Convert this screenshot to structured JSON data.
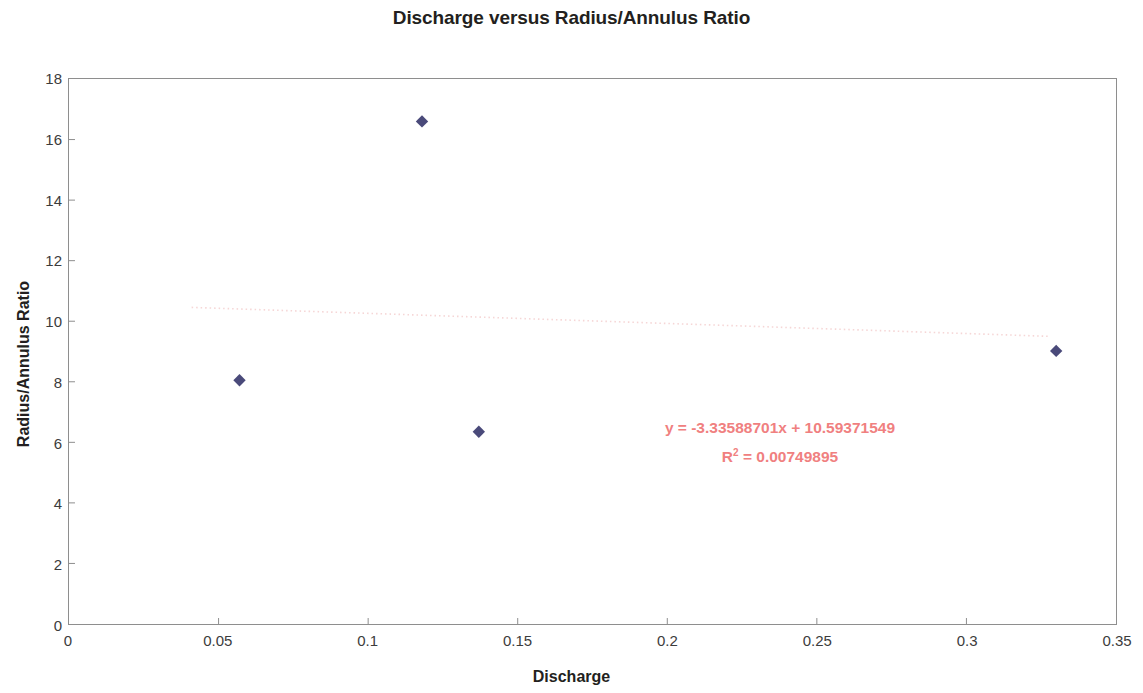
{
  "chart_data": {
    "type": "scatter",
    "title": "Discharge versus Radius/Annulus Ratio",
    "xlabel": "Discharge",
    "ylabel": "Radius/Annulus Ratio",
    "xlim": [
      0,
      0.35
    ],
    "ylim": [
      0,
      18
    ],
    "xticks": [
      "0",
      "0.05",
      "0.1",
      "0.15",
      "0.2",
      "0.25",
      "0.3",
      "0.35"
    ],
    "xtick_values": [
      0,
      0.05,
      0.1,
      0.15,
      0.2,
      0.25,
      0.3,
      0.35
    ],
    "yticks": [
      "0",
      "2",
      "4",
      "6",
      "8",
      "10",
      "12",
      "14",
      "16",
      "18"
    ],
    "ytick_values": [
      0,
      2,
      4,
      6,
      8,
      10,
      12,
      14,
      16,
      18
    ],
    "grid": false,
    "legend": "none",
    "marker_shape": "diamond",
    "marker_color": "#4a4a7a",
    "series": [
      {
        "name": "Radius/Annulus Ratio",
        "points": [
          {
            "x": 0.057,
            "y": 8.05
          },
          {
            "x": 0.118,
            "y": 16.6
          },
          {
            "x": 0.137,
            "y": 6.35
          },
          {
            "x": 0.33,
            "y": 9.02
          }
        ]
      }
    ],
    "trendline": {
      "type": "linear",
      "slope": -3.33588701,
      "intercept": 10.59371549,
      "r_squared": 0.00749895,
      "color": "#f3c9c9",
      "style": "dotted",
      "x_start": 0.041,
      "x_end": 0.328
    },
    "annotations": {
      "equation": "y = -3.33588701x + 10.59371549",
      "r_squared_prefix": "R",
      "r_squared_exponent": "2",
      "r_squared_value": " = 0.00749895",
      "color": "#f08080"
    }
  }
}
